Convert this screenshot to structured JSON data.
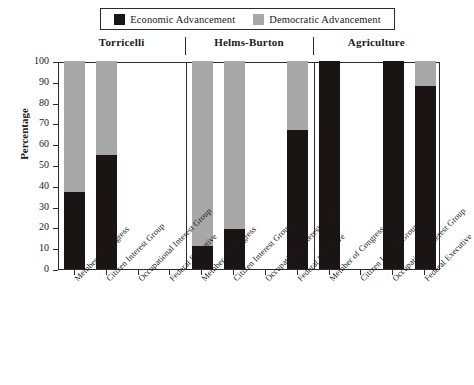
{
  "chart_data": {
    "type": "bar",
    "subtype": "stacked-percentage",
    "title": "",
    "xlabel": "",
    "ylabel": "Percentage",
    "ylim": [
      0,
      100
    ],
    "ytick_labels": [
      "0",
      "10",
      "20",
      "30",
      "40",
      "50",
      "60",
      "70",
      "80",
      "90",
      "100"
    ],
    "ytick_values": [
      0,
      10,
      20,
      30,
      40,
      50,
      60,
      70,
      80,
      90,
      100
    ],
    "grid": false,
    "legend_position": "top-center",
    "legend": [
      {
        "label": "Economic Advancement",
        "color": "#1a1414"
      },
      {
        "label": "Democratic Advancement",
        "color": "#a8a8a8"
      }
    ],
    "series": [
      {
        "name": "Economic Advancement",
        "color": "#1a1414"
      },
      {
        "name": "Democratic Advancement",
        "color": "#a8a8a8"
      }
    ],
    "categories": [
      "Member of Congress",
      "Citizen Interest Group",
      "Occupational Interest Group",
      "Federal Executive"
    ],
    "groups": [
      {
        "name": "Torricelli",
        "bars": [
          {
            "category": "Member of Congress",
            "economic": 37,
            "democratic": 63,
            "empty": false
          },
          {
            "category": "Citizen Interest Group",
            "economic": 55,
            "democratic": 45,
            "empty": false
          },
          {
            "category": "Occupational Interest Group",
            "economic": 0,
            "democratic": 0,
            "empty": true
          },
          {
            "category": "Federal Executive",
            "economic": 0,
            "democratic": 0,
            "empty": true
          }
        ]
      },
      {
        "name": "Helms-Burton",
        "bars": [
          {
            "category": "Member of Congress",
            "economic": 11,
            "democratic": 89,
            "empty": false
          },
          {
            "category": "Citizen Interest Group",
            "economic": 19,
            "democratic": 81,
            "empty": false
          },
          {
            "category": "Occupational Interest Group",
            "economic": 0,
            "democratic": 0,
            "empty": true
          },
          {
            "category": "Federal Executive",
            "economic": 67,
            "democratic": 33,
            "empty": false
          }
        ]
      },
      {
        "name": "Agriculture",
        "bars": [
          {
            "category": "Member of Congress",
            "economic": 100,
            "democratic": 0,
            "empty": false
          },
          {
            "category": "Citizen Interest Group",
            "economic": 0,
            "democratic": 0,
            "empty": true
          },
          {
            "category": "Occupational Interest Group",
            "economic": 100,
            "democratic": 0,
            "empty": false
          },
          {
            "category": "Federal Executive",
            "economic": 88,
            "democratic": 12,
            "empty": false
          }
        ]
      }
    ]
  },
  "colors": {
    "economic": "#1a1414",
    "democratic": "#a8a8a8",
    "axis": "#2b2b2b",
    "background": "#ffffff"
  }
}
